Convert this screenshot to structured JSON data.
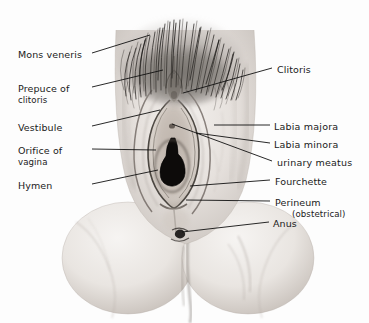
{
  "figure": {
    "width": 369,
    "height": 323,
    "background_color": "#fdfdfd",
    "ink_color": "#1a1a1a",
    "style": "grayscale pencil/halftone medical illustration with leader-line callouts"
  },
  "labels_left": [
    {
      "id": "mons-veneris",
      "text": "Mons veneris",
      "text2": "",
      "x": 18,
      "y": 49
    },
    {
      "id": "prepuce-clitoris",
      "text": "Prepuce of",
      "text2": "clitoris",
      "x": 18,
      "y": 83
    },
    {
      "id": "vestibule",
      "text": "Vestibule",
      "text2": "",
      "x": 18,
      "y": 122
    },
    {
      "id": "orifice-vagina",
      "text": "Orifice of",
      "text2": "vagina",
      "x": 18,
      "y": 145
    },
    {
      "id": "hymen",
      "text": "Hymen",
      "text2": "",
      "x": 18,
      "y": 180
    }
  ],
  "labels_right": [
    {
      "id": "clitoris",
      "text": "Clitoris",
      "text2": "",
      "x": 277,
      "y": 64
    },
    {
      "id": "labia-majora",
      "text": "Labia  majora",
      "text2": "",
      "x": 274,
      "y": 121
    },
    {
      "id": "labia-minora",
      "text": "Labia  minora",
      "text2": "",
      "x": 274,
      "y": 139
    },
    {
      "id": "urinary-meatus",
      "text": "urinary  meatus",
      "text2": "",
      "x": 277,
      "y": 157
    },
    {
      "id": "fourchette",
      "text": "Fourchette",
      "text2": "",
      "x": 275,
      "y": 176
    },
    {
      "id": "perineum",
      "text": "Perineum",
      "text2": "(obstetrical)",
      "x": 275,
      "y": 197
    },
    {
      "id": "anus",
      "text": "Anus",
      "text2": "",
      "x": 273,
      "y": 218
    }
  ],
  "leader_lines": [
    {
      "id": "leader-mons-veneris",
      "x1": 92,
      "y1": 53,
      "x2": 150,
      "y2": 35
    },
    {
      "id": "leader-prepuce-clitoris",
      "x1": 92,
      "y1": 87,
      "x2": 163,
      "y2": 70
    },
    {
      "id": "leader-vestibule",
      "x1": 92,
      "y1": 126,
      "x2": 160,
      "y2": 110
    },
    {
      "id": "leader-orifice-vagina",
      "x1": 92,
      "y1": 149,
      "x2": 156,
      "y2": 150
    },
    {
      "id": "leader-hymen",
      "x1": 92,
      "y1": 184,
      "x2": 158,
      "y2": 170
    },
    {
      "id": "leader-clitoris",
      "x1": 272,
      "y1": 68,
      "x2": 183,
      "y2": 93
    },
    {
      "id": "leader-labia-majora",
      "x1": 270,
      "y1": 125,
      "x2": 214,
      "y2": 125
    },
    {
      "id": "leader-labia-minora",
      "x1": 270,
      "y1": 143,
      "x2": 196,
      "y2": 133
    },
    {
      "id": "leader-urinary-meatus",
      "x1": 272,
      "y1": 161,
      "x2": 172,
      "y2": 124
    },
    {
      "id": "leader-fourchette",
      "x1": 270,
      "y1": 180,
      "x2": 190,
      "y2": 186
    },
    {
      "id": "leader-perineum",
      "x1": 270,
      "y1": 201,
      "x2": 186,
      "y2": 200
    },
    {
      "id": "leader-anus",
      "x1": 269,
      "y1": 222,
      "x2": 182,
      "y2": 232
    }
  ],
  "illustration_parts": [
    {
      "id": "pubic-hair-mons",
      "label": "Mons veneris pubic hair"
    },
    {
      "id": "labia-majora-left",
      "label": "Left labium majus"
    },
    {
      "id": "labia-majora-right",
      "label": "Right labium majus"
    },
    {
      "id": "labia-minora",
      "label": "Labia minora inner folds"
    },
    {
      "id": "vestibule-area",
      "label": "Vestibule"
    },
    {
      "id": "vaginal-orifice",
      "label": "Vaginal orifice (dark opening)"
    },
    {
      "id": "perineum-area",
      "label": "Perineal body"
    },
    {
      "id": "anus-mark",
      "label": "Anus"
    },
    {
      "id": "thigh-left",
      "label": "Left thigh / buttock"
    },
    {
      "id": "thigh-right",
      "label": "Right thigh / buttock"
    }
  ]
}
